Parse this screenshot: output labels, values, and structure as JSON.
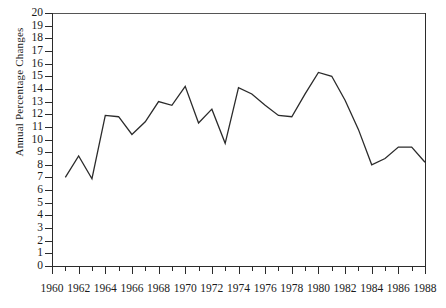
{
  "chart_data": {
    "type": "line",
    "title": "",
    "xlabel": "",
    "ylabel": "Annual Percentage Changes",
    "xlim": [
      1960,
      1988
    ],
    "ylim": [
      0,
      20
    ],
    "grid": false,
    "legend": "none",
    "x_tick_labels": [
      "1960",
      "1962",
      "1964",
      "1966",
      "1968",
      "1970",
      "1972",
      "1974",
      "1976",
      "1978",
      "1980",
      "1982",
      "1984",
      "1986",
      "1988"
    ],
    "x_tick_step": 2,
    "x_minor_tick_step": 1,
    "y_tick_labels": [
      "20",
      "19",
      "18",
      "17",
      "16",
      "15",
      "14",
      "13",
      "12",
      "11",
      "10",
      "9",
      "8",
      "7",
      "6",
      "5",
      "4",
      "3",
      "2",
      "1",
      "0"
    ],
    "y_tick_step": 1,
    "line_color": "#2b2b2b",
    "x": [
      1961,
      1962,
      1963,
      1964,
      1965,
      1966,
      1967,
      1968,
      1969,
      1970,
      1971,
      1972,
      1973,
      1974,
      1975,
      1976,
      1977,
      1978,
      1979,
      1980,
      1981,
      1982,
      1983,
      1984,
      1985,
      1986,
      1987,
      1988
    ],
    "values": [
      7.0,
      8.7,
      6.9,
      11.9,
      11.8,
      10.4,
      11.4,
      13.0,
      12.7,
      14.2,
      11.3,
      12.4,
      9.7,
      14.1,
      13.6,
      12.7,
      11.9,
      11.8,
      13.6,
      15.3,
      15.0,
      13.1,
      10.8,
      8.0,
      8.5,
      9.4,
      9.4,
      8.2
    ]
  }
}
